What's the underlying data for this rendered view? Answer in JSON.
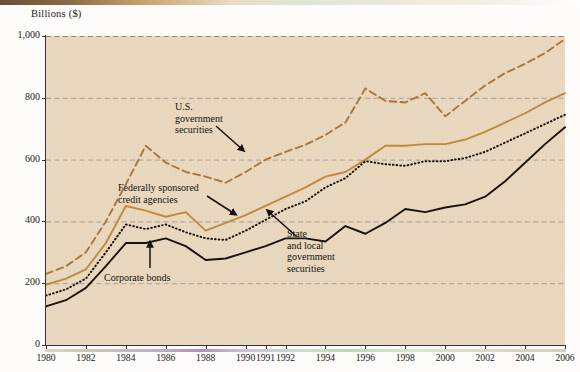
{
  "figure": {
    "y_axis_title": "Billions ($)"
  },
  "annotations": [
    {
      "id": "us-gov",
      "lines": [
        "U.S.",
        "government",
        "securities"
      ],
      "left": 175,
      "top": 101
    },
    {
      "id": "fed-credit",
      "lines": [
        "Federally sponsored",
        "credit agencies"
      ],
      "left": 118,
      "top": 182
    },
    {
      "id": "corporate-bonds",
      "lines": [
        "Corporate bonds"
      ],
      "left": 104,
      "top": 272
    },
    {
      "id": "state-local",
      "lines": [
        "State",
        "and local",
        "government",
        "securities"
      ],
      "left": 287,
      "top": 228
    }
  ],
  "chart_data": {
    "type": "line",
    "title": "",
    "subtitle": "",
    "xlabel": "",
    "ylabel": "Billions ($)",
    "xlim": [
      1980,
      2006
    ],
    "ylim": [
      0,
      1000
    ],
    "grid": true,
    "legend_position": "inline-annotations",
    "x_tick_labels": [
      "1980",
      "1982",
      "1984",
      "1986",
      "1988",
      "1990",
      "1991",
      "1992",
      "1994",
      "1996",
      "1998",
      "2000",
      "2002",
      "2004",
      "2006"
    ],
    "y_tick_labels": [
      "0",
      "200",
      "400",
      "600",
      "800",
      "1,000"
    ],
    "y_ticks": [
      0,
      200,
      400,
      600,
      800,
      1000
    ],
    "x": [
      1980,
      1981,
      1982,
      1983,
      1984,
      1985,
      1986,
      1987,
      1988,
      1989,
      1990,
      1991,
      1992,
      1993,
      1994,
      1995,
      1996,
      1997,
      1998,
      1999,
      2000,
      2001,
      2002,
      2003,
      2004,
      2005,
      2006
    ],
    "series": [
      {
        "name": "U.S. government securities",
        "style": "dashed",
        "color": "#a9763b",
        "values": [
          230,
          255,
          300,
          400,
          520,
          645,
          590,
          560,
          545,
          525,
          560,
          600,
          625,
          648,
          680,
          720,
          830,
          790,
          785,
          815,
          740,
          790,
          840,
          880,
          910,
          945,
          990
        ]
      },
      {
        "name": "Federally sponsored credit agencies",
        "style": "solid",
        "color": "#bf8a3d",
        "values": [
          195,
          215,
          245,
          330,
          450,
          435,
          415,
          430,
          370,
          395,
          420,
          450,
          480,
          510,
          545,
          560,
          600,
          645,
          645,
          650,
          650,
          665,
          690,
          720,
          750,
          785,
          815
        ]
      },
      {
        "name": "State and local government securities",
        "style": "dotted",
        "color": "#17120e",
        "values": [
          160,
          180,
          215,
          300,
          390,
          375,
          390,
          365,
          345,
          340,
          370,
          405,
          440,
          465,
          510,
          540,
          595,
          585,
          580,
          595,
          595,
          605,
          625,
          655,
          685,
          715,
          745
        ]
      },
      {
        "name": "Corporate bonds",
        "style": "solid",
        "color": "#17120e",
        "values": [
          125,
          145,
          185,
          255,
          330,
          330,
          345,
          320,
          275,
          280,
          300,
          320,
          345,
          345,
          335,
          385,
          360,
          395,
          440,
          430,
          445,
          455,
          480,
          530,
          590,
          650,
          705
        ]
      }
    ]
  }
}
